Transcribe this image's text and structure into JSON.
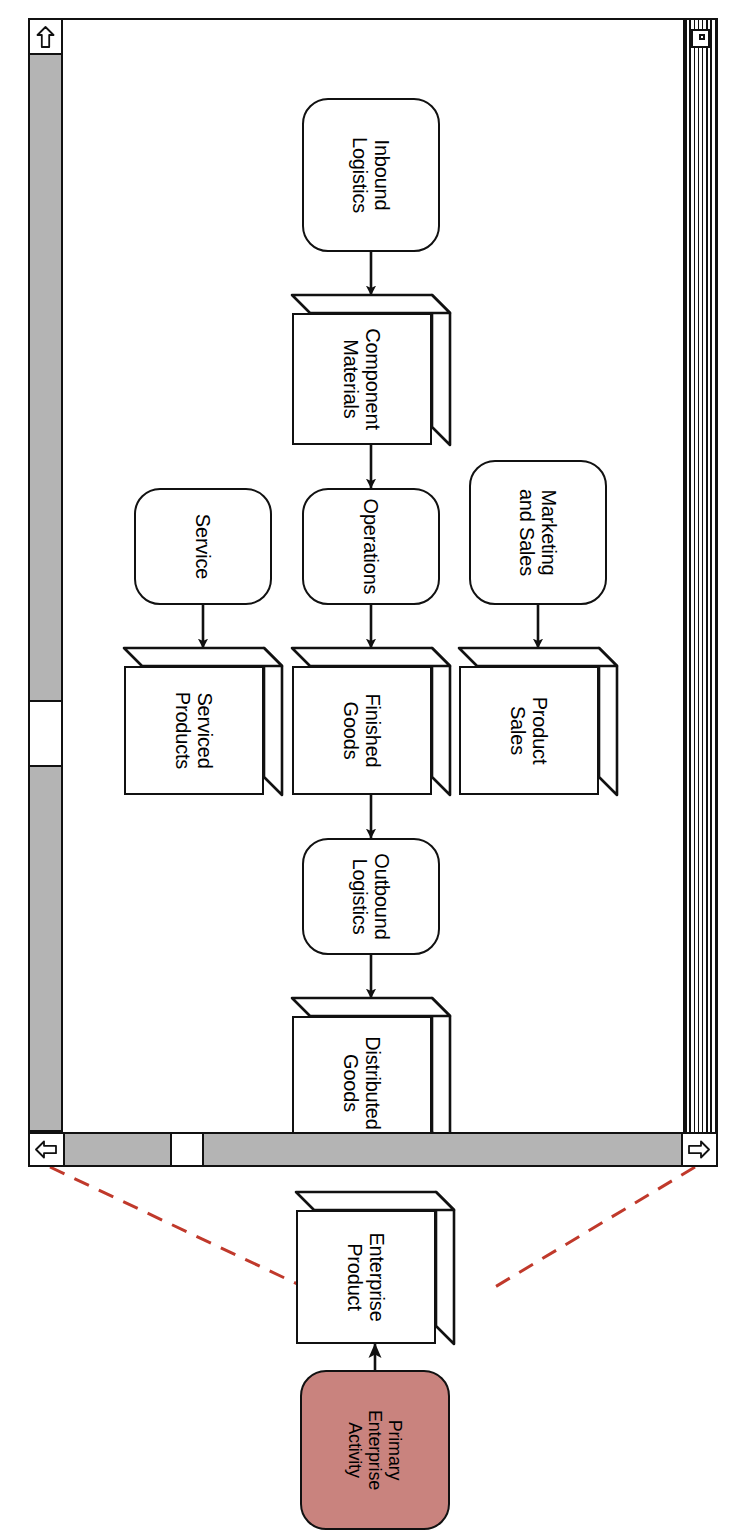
{
  "window": {
    "title": "",
    "close_box": "close-box",
    "size_box": "size-box",
    "scrollbars": {
      "horizontal": {
        "left_arrow": "⇦",
        "right_arrow": "⇨",
        "thumb_position_pct": 62
      },
      "vertical": {
        "up_arrow": "⇧",
        "down_arrow": "⇩",
        "thumb_position_pct": 80
      }
    }
  },
  "diagram": {
    "nodes": [
      {
        "id": "inbound-logistics",
        "label": "Inbound\nLogistics",
        "shape": "rounded-rect",
        "fill": "#ffffff"
      },
      {
        "id": "component-materials",
        "label": "Component\nMaterials",
        "shape": "box3d",
        "fill": "#ffffff"
      },
      {
        "id": "operations",
        "label": "Operations",
        "shape": "rounded-rect",
        "fill": "#ffffff"
      },
      {
        "id": "finished-goods",
        "label": "Finished\nGoods",
        "shape": "box3d",
        "fill": "#ffffff"
      },
      {
        "id": "outbound-logistics",
        "label": "Outbound\nLogistics",
        "shape": "rounded-rect",
        "fill": "#ffffff"
      },
      {
        "id": "distributed-goods",
        "label": "Distributed\nGoods",
        "shape": "box3d",
        "fill": "#ffffff"
      },
      {
        "id": "marketing-and-sales",
        "label": "Marketing\nand Sales",
        "shape": "rounded-rect",
        "fill": "#ffffff"
      },
      {
        "id": "product-sales",
        "label": "Product\nSales",
        "shape": "box3d",
        "fill": "#ffffff"
      },
      {
        "id": "service",
        "label": "Service",
        "shape": "rounded-rect",
        "fill": "#ffffff"
      },
      {
        "id": "serviced-products",
        "label": "Serviced\nProducts",
        "shape": "box3d",
        "fill": "#ffffff"
      }
    ],
    "edges": [
      {
        "from": "inbound-logistics",
        "to": "component-materials"
      },
      {
        "from": "component-materials",
        "to": "operations"
      },
      {
        "from": "operations",
        "to": "finished-goods"
      },
      {
        "from": "finished-goods",
        "to": "outbound-logistics"
      },
      {
        "from": "outbound-logistics",
        "to": "distributed-goods"
      },
      {
        "from": "marketing-and-sales",
        "to": "product-sales"
      },
      {
        "from": "service",
        "to": "serviced-products"
      }
    ]
  },
  "legend": {
    "activity": {
      "id": "primary-enterprise-activity",
      "label": "Primary\nEnterprise\nActivity",
      "shape": "rounded-rect",
      "fill": "#c9837e"
    },
    "product": {
      "id": "enterprise-product",
      "label": "Enterprise\nProduct",
      "shape": "box3d",
      "fill": "#ffffff"
    },
    "edge": {
      "from": "primary-enterprise-activity",
      "to": "enterprise-product"
    },
    "callout_color": "#c0392b",
    "callout_style": "dashed"
  },
  "colors": {
    "outline": "#111111",
    "paper": "#ffffff",
    "scrollbar_track": "#b4b4b4",
    "primary_activity_fill": "#c9837e",
    "callout_red": "#c0392b"
  }
}
